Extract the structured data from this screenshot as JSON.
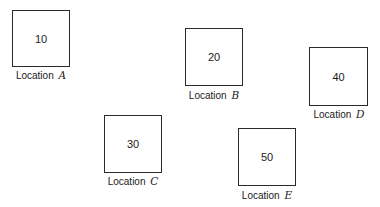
{
  "diagram": {
    "locations": [
      {
        "id": "A",
        "value": "10",
        "label_prefix": "Location",
        "label_var": "A"
      },
      {
        "id": "B",
        "value": "20",
        "label_prefix": "Location",
        "label_var": "B"
      },
      {
        "id": "C",
        "value": "30",
        "label_prefix": "Location",
        "label_var": "C"
      },
      {
        "id": "D",
        "value": "40",
        "label_prefix": "Location",
        "label_var": "D"
      },
      {
        "id": "E",
        "value": "50",
        "label_prefix": "Location",
        "label_var": "E"
      }
    ]
  }
}
